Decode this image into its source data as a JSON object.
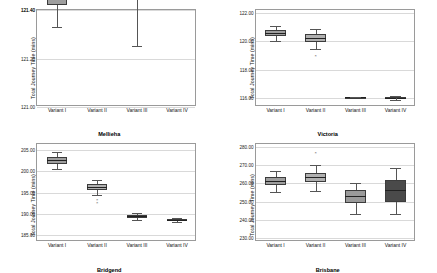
{
  "chart_data": [
    {
      "type": "box",
      "title": "Mellieha",
      "ylabel": "Total Journey Time (mins)",
      "xlabel": "",
      "categories": [
        "Variant I",
        "Variant II",
        "Variant III",
        "Variant IV"
      ],
      "yticks": [
        "121.40",
        "122.20",
        "122.00",
        "121.80",
        "121.60",
        "121.40",
        "121.20",
        "121.00"
      ],
      "ylim": [
        121.0,
        121.4
      ],
      "grid": true,
      "legend": "none",
      "boxes": [
        {
          "category": "Variant I",
          "min": 121.33,
          "q1": 121.42,
          "median": 121.47,
          "q3": 121.52,
          "max": 121.62,
          "outliers": [],
          "fill": "#9e9e9e"
        },
        {
          "category": "Variant II",
          "min": 121.62,
          "q1": 121.77,
          "median": 121.85,
          "q3": 121.94,
          "max": 122.05,
          "outliers": [
            122.22
          ],
          "fill": "#b0b0b0"
        },
        {
          "category": "Variant III",
          "min": 121.25,
          "q1": 121.52,
          "median": 121.73,
          "q3": 121.93,
          "max": 122.02,
          "outliers": [],
          "fill": "#9a9a9a"
        },
        {
          "category": "Variant IV",
          "min": 121.6,
          "q1": 121.7,
          "median": 121.84,
          "q3": 121.98,
          "max": 122.05,
          "outliers": [],
          "fill": "#4a4a4a"
        }
      ]
    },
    {
      "type": "box",
      "title": "Victoria",
      "ylabel": "Total Journey Time (mins)",
      "xlabel": "",
      "categories": [
        "Variant I",
        "Variant II",
        "Variant III",
        "Variant IV"
      ],
      "yticks": [
        "122.00",
        "120.00",
        "118.00",
        "116.00"
      ],
      "ylim": [
        115.4,
        122.2
      ],
      "grid": true,
      "legend": "none",
      "boxes": [
        {
          "category": "Variant I",
          "min": 120.0,
          "q1": 120.35,
          "median": 120.6,
          "q3": 120.8,
          "max": 121.1,
          "outliers": [],
          "fill": "#9e9e9e"
        },
        {
          "category": "Variant II",
          "min": 119.5,
          "q1": 119.95,
          "median": 120.25,
          "q3": 120.5,
          "max": 120.85,
          "outliers": [
            119.0
          ],
          "fill": "#b0b0b0"
        },
        {
          "category": "Variant III",
          "min": 116.1,
          "q1": 116.1,
          "median": 116.1,
          "q3": 116.1,
          "max": 116.1,
          "outliers": [],
          "fill": "#9a9a9a"
        },
        {
          "category": "Variant IV",
          "min": 115.9,
          "q1": 116.0,
          "median": 116.05,
          "q3": 116.1,
          "max": 116.2,
          "outliers": [],
          "fill": "#4a4a4a"
        }
      ]
    },
    {
      "type": "box",
      "title": "Bridgend",
      "ylabel": "Total Journey Time (mins)",
      "xlabel": "",
      "categories": [
        "Variant I",
        "Variant II",
        "Variant III",
        "Variant IV"
      ],
      "yticks": [
        "205.00",
        "200.00",
        "195.00",
        "190.00",
        "185.00"
      ],
      "ylim": [
        183.5,
        206.5
      ],
      "grid": true,
      "legend": "none",
      "boxes": [
        {
          "category": "Variant I",
          "min": 200.6,
          "q1": 201.6,
          "median": 202.6,
          "q3": 203.4,
          "max": 204.6,
          "outliers": [],
          "fill": "#9e9e9e"
        },
        {
          "category": "Variant II",
          "min": 194.4,
          "q1": 195.7,
          "median": 196.3,
          "q3": 197.1,
          "max": 198.0,
          "outliers": [
            193.2,
            192.5
          ],
          "fill": "#b0b0b0"
        },
        {
          "category": "Variant III",
          "min": 188.6,
          "q1": 189.1,
          "median": 189.4,
          "q3": 189.8,
          "max": 190.3,
          "outliers": [],
          "fill": "#9a9a9a"
        },
        {
          "category": "Variant IV",
          "min": 188.1,
          "q1": 188.4,
          "median": 188.6,
          "q3": 188.8,
          "max": 189.1,
          "outliers": [],
          "fill": "#4a4a4a"
        }
      ]
    },
    {
      "type": "box",
      "title": "Brisbane",
      "ylabel": "Total Journey Time (mins)",
      "xlabel": "",
      "categories": [
        "Variant I",
        "Variant II",
        "Variant III",
        "Variant IV"
      ],
      "yticks": [
        "280.00",
        "270.00",
        "260.00",
        "250.00",
        "240.00",
        "230.00"
      ],
      "ylim": [
        228.0,
        282.0
      ],
      "grid": true,
      "legend": "none",
      "boxes": [
        {
          "category": "Variant I",
          "min": 255.5,
          "q1": 259.0,
          "median": 261.5,
          "q3": 263.5,
          "max": 267.0,
          "outliers": [],
          "fill": "#9e9e9e"
        },
        {
          "category": "Variant II",
          "min": 256.0,
          "q1": 261.0,
          "median": 263.5,
          "q3": 266.0,
          "max": 270.0,
          "outliers": [
            277.0
          ],
          "fill": "#b0b0b0"
        },
        {
          "category": "Variant III",
          "min": 243.0,
          "q1": 249.0,
          "median": 253.0,
          "q3": 256.5,
          "max": 260.0,
          "outliers": [],
          "fill": "#9a9a9a"
        },
        {
          "category": "Variant IV",
          "min": 243.0,
          "q1": 250.0,
          "median": 256.5,
          "q3": 262.0,
          "max": 268.5,
          "outliers": [],
          "fill": "#4a4a4a"
        }
      ]
    }
  ]
}
